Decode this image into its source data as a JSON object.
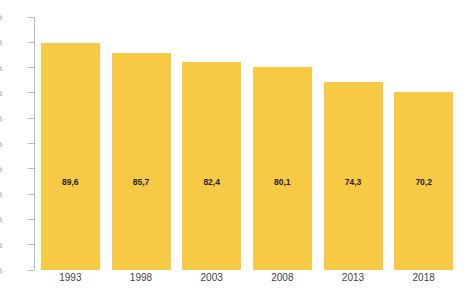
{
  "chart_data": {
    "type": "bar",
    "title": "",
    "subtitle": "",
    "xlabel": "",
    "ylabel": "",
    "categories": [
      "1993",
      "1998",
      "2003",
      "2008",
      "2013",
      "2018"
    ],
    "values": [
      89.6,
      85.7,
      82.4,
      80.1,
      74.3,
      70.2
    ],
    "value_labels": [
      "89,6",
      "85,7",
      "82,4",
      "80,1",
      "74,3",
      "70,2"
    ],
    "ylim": [
      0,
      100
    ],
    "y_ticks": [
      0,
      10,
      20,
      30,
      40,
      50,
      60,
      70,
      80,
      90,
      100
    ],
    "y_tick_labels": [
      "0%",
      "10%",
      "20%",
      "30%",
      "40%",
      "50%",
      "60%",
      "70%",
      "80%",
      "90%",
      "100%"
    ],
    "grid": false,
    "legend": false,
    "legend_position": "none",
    "series": [
      {
        "name": "",
        "values": [
          89.6,
          85.7,
          82.4,
          80.1,
          74.3,
          70.2
        ]
      }
    ],
    "colors": {
      "bar": "#f7c945",
      "value_label": "#231f20",
      "axis_line": "#b9b9b9",
      "y_tick_label": "#8a8a8a",
      "x_label": "#3f3f3f",
      "background": "#ffffff"
    }
  }
}
